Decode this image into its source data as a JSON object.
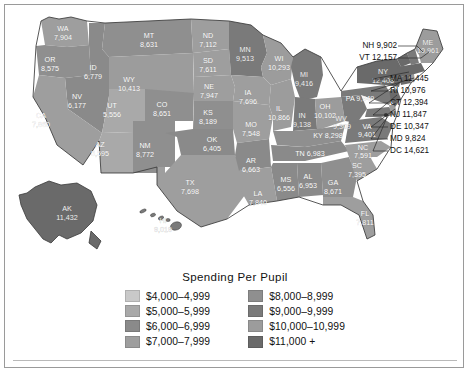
{
  "title": "Spending Per Pupil",
  "legend": {
    "title": "Spending Per Pupil",
    "columns": [
      [
        {
          "label": "$4,000–4,999",
          "color": "#c9c9c9",
          "min": 4000,
          "max": 4999
        },
        {
          "label": "$5,000–5,999",
          "color": "#a9a9a9",
          "min": 5000,
          "max": 5999
        },
        {
          "label": "$6,000–6,999",
          "color": "#8a8a8a",
          "min": 6000,
          "max": 6999
        },
        {
          "label": "$7,000–7,999",
          "color": "#9e9e9e",
          "min": 7000,
          "max": 7999
        }
      ],
      [
        {
          "label": "$8,000–8,999",
          "color": "#8f8f8f",
          "min": 8000,
          "max": 8999
        },
        {
          "label": "$9,000–9,999",
          "color": "#7a7a7a",
          "min": 9000,
          "max": 9999
        },
        {
          "label": "$10,000–10,999",
          "color": "#9c9c9c",
          "min": 10000,
          "max": 10999
        },
        {
          "label": "$11,000 +",
          "color": "#6a6a6a",
          "min": 11000,
          "max": 999999
        }
      ]
    ]
  },
  "chart_data": {
    "type": "map",
    "title": "Spending Per Pupil",
    "units": "US dollars per pupil",
    "regions": [
      {
        "code": "WA",
        "value": 7904,
        "label": "7,904"
      },
      {
        "code": "OR",
        "value": 8575,
        "label": "8,575"
      },
      {
        "code": "ID",
        "value": 6779,
        "label": "6,779"
      },
      {
        "code": "MT",
        "value": 8631,
        "label": "8,631"
      },
      {
        "code": "WY",
        "value": 10413,
        "label": "10,413"
      },
      {
        "code": "NV",
        "value": 6177,
        "label": "6,177"
      },
      {
        "code": "UT",
        "value": 5556,
        "label": "5,556"
      },
      {
        "code": "CA",
        "value": 7860,
        "label": "7,860"
      },
      {
        "code": "AZ",
        "value": 5595,
        "label": "5,595"
      },
      {
        "code": "NM",
        "value": 8772,
        "label": "8,772"
      },
      {
        "code": "CO",
        "value": 8651,
        "label": "8,651"
      },
      {
        "code": "ND",
        "value": 7112,
        "label": "7,112"
      },
      {
        "code": "SD",
        "value": 7611,
        "label": "7,611"
      },
      {
        "code": "NE",
        "value": 7947,
        "label": "7,947"
      },
      {
        "code": "KS",
        "value": 8189,
        "label": "8,189"
      },
      {
        "code": "OK",
        "value": 6405,
        "label": "6,405"
      },
      {
        "code": "TX",
        "value": 7698,
        "label": "7,698"
      },
      {
        "code": "MN",
        "value": 9513,
        "label": "9,513"
      },
      {
        "code": "IA",
        "value": 7696,
        "label": "7,696"
      },
      {
        "code": "MO",
        "value": 7548,
        "label": "7,548"
      },
      {
        "code": "AR",
        "value": 6663,
        "label": "6,663"
      },
      {
        "code": "LA",
        "value": 7840,
        "label": "7,840"
      },
      {
        "code": "WI",
        "value": 10293,
        "label": "10,293"
      },
      {
        "code": "IL",
        "value": 10866,
        "label": "10,866"
      },
      {
        "code": "MI",
        "value": 9416,
        "label": "9,416"
      },
      {
        "code": "IN",
        "value": 9138,
        "label": "9,138"
      },
      {
        "code": "OH",
        "value": 10102,
        "label": "10,102"
      },
      {
        "code": "KY",
        "value": 8298,
        "label": "8,298"
      },
      {
        "code": "TN",
        "value": 6983,
        "label": "6,983"
      },
      {
        "code": "MS",
        "value": 6556,
        "label": "6,556"
      },
      {
        "code": "AL",
        "value": 6953,
        "label": "6,953"
      },
      {
        "code": "GA",
        "value": 8671,
        "label": "8,671"
      },
      {
        "code": "FL",
        "value": 7811,
        "label": "7,811"
      },
      {
        "code": "SC",
        "value": 7395,
        "label": "7,395"
      },
      {
        "code": "NC",
        "value": 7591,
        "label": "7,591"
      },
      {
        "code": "VA",
        "value": 9401,
        "label": "9,401"
      },
      {
        "code": "WV",
        "value": 9309,
        "label": "9,309"
      },
      {
        "code": "PA",
        "value": 9949,
        "label": "9,949"
      },
      {
        "code": "NY",
        "value": 12408,
        "label": "12,408"
      },
      {
        "code": "ME",
        "value": 10961,
        "label": "10,961"
      },
      {
        "code": "NH",
        "value": 9902,
        "label": "9,902"
      },
      {
        "code": "VT",
        "value": 12157,
        "label": "12,157"
      },
      {
        "code": "MA",
        "value": 11445,
        "label": "11,445"
      },
      {
        "code": "RI",
        "value": 10976,
        "label": "10,976"
      },
      {
        "code": "CT",
        "value": 12394,
        "label": "12,394"
      },
      {
        "code": "NJ",
        "value": 11847,
        "label": "11,847"
      },
      {
        "code": "DE",
        "value": 10347,
        "label": "10,347"
      },
      {
        "code": "MD",
        "value": 9824,
        "label": "9,824"
      },
      {
        "code": "DC",
        "value": 14621,
        "label": "14,621"
      },
      {
        "code": "AK",
        "value": 11432,
        "label": "11,432"
      },
      {
        "code": "HI",
        "value": 9019,
        "label": "9,019"
      }
    ]
  },
  "map_labels": {
    "inline": [
      {
        "code": "WA",
        "name": "WA",
        "value": "7,904",
        "x": 58,
        "y": 26,
        "fill": "#9e9e9e",
        "dark": false
      },
      {
        "code": "OR",
        "name": "OR",
        "value": "8,575",
        "x": 45,
        "y": 57,
        "fill": "#8f8f8f",
        "dark": false
      },
      {
        "code": "ID",
        "name": "ID",
        "value": "6,779",
        "x": 88,
        "y": 65,
        "fill": "#8a8a8a",
        "dark": false
      },
      {
        "code": "MT",
        "name": "MT",
        "value": "8,631",
        "x": 144,
        "y": 33,
        "fill": "#8f8f8f",
        "dark": false
      },
      {
        "code": "WY",
        "name": "WY",
        "value": "10,413",
        "x": 124,
        "y": 77,
        "fill": "#9c9c9c",
        "dark": false
      },
      {
        "code": "NV",
        "name": "NV",
        "value": "6,177",
        "x": 72,
        "y": 94,
        "fill": "#8a8a8a",
        "dark": false
      },
      {
        "code": "UT",
        "name": "UT",
        "value": "5,556",
        "x": 107,
        "y": 103,
        "fill": "#a9a9a9",
        "dark": false
      },
      {
        "code": "CA",
        "name": "CA",
        "value": "7,860",
        "x": 36,
        "y": 113,
        "fill": "#9e9e9e",
        "dark": false
      },
      {
        "code": "AZ",
        "name": "AZ",
        "value": "5,595",
        "x": 95,
        "y": 142,
        "fill": "#a9a9a9",
        "dark": false
      },
      {
        "code": "NM",
        "name": "NM",
        "value": "8,772",
        "x": 140,
        "y": 143,
        "fill": "#8f8f8f",
        "dark": false
      },
      {
        "code": "CO",
        "name": "CO",
        "value": "8,651",
        "x": 157,
        "y": 102,
        "fill": "#8f8f8f",
        "dark": false
      },
      {
        "code": "ND",
        "name": "ND",
        "value": "7,112",
        "x": 203,
        "y": 33,
        "fill": "#9e9e9e",
        "dark": false
      },
      {
        "code": "SD",
        "name": "SD",
        "value": "7,611",
        "x": 203,
        "y": 58,
        "fill": "#9e9e9e",
        "dark": false
      },
      {
        "code": "NE",
        "name": "NE",
        "value": "7,947",
        "x": 204,
        "y": 84,
        "fill": "#9e9e9e",
        "dark": false
      },
      {
        "code": "KS",
        "name": "KS",
        "value": "8,189",
        "x": 203,
        "y": 110,
        "fill": "#8f8f8f",
        "dark": false
      },
      {
        "code": "OK",
        "name": "OK",
        "value": "6,405",
        "x": 207,
        "y": 137,
        "fill": "#8a8a8a",
        "dark": false
      },
      {
        "code": "TX",
        "name": "TX",
        "value": "7,698",
        "x": 185,
        "y": 180,
        "fill": "#9e9e9e",
        "dark": false
      },
      {
        "code": "MN",
        "name": "MN",
        "value": "9,513",
        "x": 240,
        "y": 47,
        "fill": "#7a7a7a",
        "dark": true
      },
      {
        "code": "IA",
        "name": "IA",
        "value": "7,696",
        "x": 243,
        "y": 90,
        "fill": "#9e9e9e",
        "dark": false
      },
      {
        "code": "MO",
        "name": "MO",
        "value": "7,548",
        "x": 246,
        "y": 122,
        "fill": "#9e9e9e",
        "dark": false
      },
      {
        "code": "AR",
        "name": "AR",
        "value": "6,663",
        "x": 246,
        "y": 158,
        "fill": "#8a8a8a",
        "dark": false
      },
      {
        "code": "LA",
        "name": "LA",
        "value": "7,840",
        "x": 253,
        "y": 191,
        "fill": "#9e9e9e",
        "dark": false
      },
      {
        "code": "WI",
        "name": "WI",
        "value": "10,293",
        "x": 274,
        "y": 56,
        "fill": "#9c9c9c",
        "dark": false
      },
      {
        "code": "IL",
        "name": "IL",
        "value": "10,866",
        "x": 274,
        "y": 106,
        "fill": "#9c9c9c",
        "dark": false
      },
      {
        "code": "MI",
        "name": "MI",
        "value": "9,416",
        "x": 299,
        "y": 72,
        "fill": "#7a7a7a",
        "dark": true
      },
      {
        "code": "IN",
        "name": "IN",
        "value": "9,138",
        "x": 297,
        "y": 113,
        "fill": "#7a7a7a",
        "dark": true
      },
      {
        "code": "OH",
        "name": "OH",
        "value": "10,102",
        "x": 320,
        "y": 104,
        "fill": "#9c9c9c",
        "dark": false
      },
      {
        "code": "MS",
        "name": "MS",
        "value": "6,556",
        "x": 281,
        "y": 177,
        "fill": "#8a8a8a",
        "dark": false
      },
      {
        "code": "AL",
        "name": "AL",
        "value": "6,953",
        "x": 303,
        "y": 174,
        "fill": "#8a8a8a",
        "dark": false
      },
      {
        "code": "GA",
        "name": "GA",
        "value": "8,671",
        "x": 328,
        "y": 180,
        "fill": "#8f8f8f",
        "dark": false
      },
      {
        "code": "FL",
        "name": "FL",
        "value": "7,811",
        "x": 360,
        "y": 211,
        "fill": "#9e9e9e",
        "dark": false
      },
      {
        "code": "SC",
        "name": "SC",
        "value": "7,395",
        "x": 352,
        "y": 163,
        "fill": "#9e9e9e",
        "dark": false
      },
      {
        "code": "AK",
        "name": "AK",
        "value": "11,432",
        "x": 62,
        "y": 206,
        "fill": "#6a6a6a",
        "dark": true
      },
      {
        "code": "HI",
        "name": "HI",
        "value": "9,019",
        "x": 158,
        "y": 218,
        "fill": "#7a7a7a",
        "dark": true
      }
    ],
    "inline_single": [
      {
        "code": "KY",
        "text": "KY 8,298",
        "x": 323,
        "y": 133,
        "dark": false
      },
      {
        "code": "TN",
        "text": "TN 6,983",
        "x": 305,
        "y": 151,
        "dark": false
      },
      {
        "code": "PA",
        "text": "PA 9,949",
        "x": 355,
        "y": 96,
        "dark": false
      },
      {
        "code": "NC",
        "text": "NC",
        "x": 358,
        "y": 145,
        "dark": false
      },
      {
        "code": "NCV",
        "text": "7,591",
        "x": 358,
        "y": 153,
        "dark": false
      },
      {
        "code": "WV",
        "text": "WV",
        "x": 336,
        "y": 116,
        "dark": true
      },
      {
        "code": "WVV",
        "text": "9,309",
        "x": 337,
        "y": 124,
        "dark": true
      },
      {
        "code": "VA",
        "text": "VA",
        "x": 362,
        "y": 124,
        "dark": false
      },
      {
        "code": "VAV",
        "text": "9,401",
        "x": 362,
        "y": 132,
        "dark": false
      },
      {
        "code": "NY",
        "text": "NY",
        "x": 378,
        "y": 69,
        "dark": true
      },
      {
        "code": "NYV",
        "text": "12,408",
        "x": 378,
        "y": 78,
        "dark": true
      },
      {
        "code": "ME",
        "text": "ME",
        "x": 423,
        "y": 40,
        "dark": true
      },
      {
        "code": "MEV",
        "text": "10,961",
        "x": 423,
        "y": 48,
        "dark": true
      }
    ],
    "callouts_left": [
      {
        "code": "NH",
        "text": "NH 9,902",
        "x": 392,
        "y": 43
      },
      {
        "code": "VT",
        "text": "VT 12,157",
        "x": 392,
        "y": 55
      }
    ],
    "callouts_right": [
      {
        "code": "MA",
        "text": "MA 11,445",
        "x": 385,
        "y": 76
      },
      {
        "code": "RI",
        "text": "RI 10,976",
        "x": 385,
        "y": 88
      },
      {
        "code": "CT",
        "text": "CT 12,394",
        "x": 385,
        "y": 100
      },
      {
        "code": "NJ",
        "text": "NJ 11,847",
        "x": 385,
        "y": 112
      },
      {
        "code": "DE",
        "text": "DE 10,347",
        "x": 385,
        "y": 124
      },
      {
        "code": "MD",
        "text": "MD 9,824",
        "x": 385,
        "y": 136
      },
      {
        "code": "DC",
        "text": "DC 14,621",
        "x": 385,
        "y": 148
      }
    ]
  }
}
